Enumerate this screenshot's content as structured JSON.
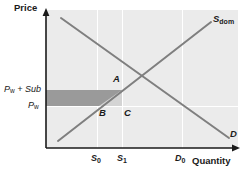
{
  "figure": {
    "type": "economics-supply-demand-diagram",
    "axes": {
      "y_label": "Price",
      "x_label": "Quantity"
    },
    "price_levels": [
      {
        "id": "pw-plus-sub",
        "label_main": "P",
        "label_sub": "w",
        "label_tail": " + Sub",
        "text": "Pw + Sub",
        "y_px": 90
      },
      {
        "id": "pw",
        "label_main": "P",
        "label_sub": "w",
        "label_tail": "",
        "text": "Pw",
        "y_px": 106
      }
    ],
    "quantity_ticks": [
      {
        "id": "s0",
        "label_main": "S",
        "label_sub": "0",
        "text": "S0",
        "x_px": 97
      },
      {
        "id": "s1",
        "label_main": "S",
        "label_sub": "1",
        "text": "S1",
        "x_px": 122
      },
      {
        "id": "d0",
        "label_main": "D",
        "label_sub": "0",
        "text": "D0",
        "x_px": 182
      }
    ],
    "curves": [
      {
        "id": "supply-domestic",
        "label_main": "S",
        "label_sub": "dom",
        "text": "Sdom",
        "x1": 58,
        "y1": 141,
        "x2": 211,
        "y2": 22
      },
      {
        "id": "demand",
        "label_main": "D",
        "label_sub": "",
        "text": "D",
        "x1": 61,
        "y1": 18,
        "x2": 229,
        "y2": 138
      }
    ],
    "points": [
      {
        "id": "point-a",
        "label": "A",
        "x_px": 113,
        "y_px": 79
      },
      {
        "id": "point-b",
        "label": "B",
        "x_px": 99,
        "y_px": 108
      },
      {
        "id": "point-c",
        "label": "C",
        "x_px": 124,
        "y_px": 108
      }
    ],
    "shaded_regions": [
      {
        "id": "subsidy-cost-rectangle",
        "color": "#9a9a9a",
        "description": "subsidy cost area between Pw and Pw+Sub up to S1"
      },
      {
        "id": "deadweight-triangle",
        "color": "#d4d4d4",
        "description": "welfare loss triangle B-A-C"
      }
    ],
    "colors": {
      "plot_background": "#ebebeb",
      "curve": "#7f7f7f",
      "axis": "#1a1a1a",
      "dark_shade": "#9a9a9a",
      "light_shade": "#d4d4d4",
      "gridline": "#ffffff"
    }
  }
}
